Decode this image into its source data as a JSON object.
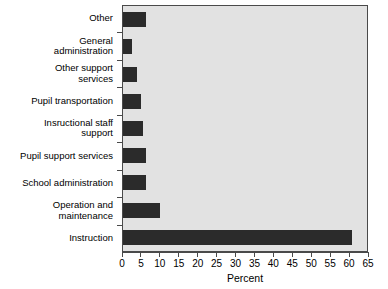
{
  "chart_data": {
    "type": "bar",
    "orientation": "horizontal",
    "title": "",
    "xlabel": "Percent",
    "ylabel": "",
    "xlim": [
      0,
      65
    ],
    "xticks": [
      0,
      5,
      10,
      15,
      20,
      25,
      30,
      35,
      40,
      45,
      50,
      55,
      60,
      65
    ],
    "xtick_labels": [
      "0",
      "5",
      "10",
      "15",
      "20",
      "25",
      "30",
      "35",
      "40",
      "45",
      "50",
      "55",
      "60",
      "65"
    ],
    "grid": false,
    "legend": null,
    "categories": [
      "Other",
      "General\nadministration",
      "Other support\nservices",
      "Pupil transportation",
      "Insructional staff\nsupport",
      "Pupil support services",
      "School administration",
      "Operation and\nmaintenance",
      "Instruction"
    ],
    "values": [
      6.0,
      2.5,
      3.6,
      4.8,
      5.2,
      6.0,
      6.0,
      9.8,
      61.0
    ],
    "bar_color": "#2b2b2b",
    "plot_background": "#e2e2e2",
    "axis_color": "#4a4a4a",
    "figure_background": "#ffffff"
  }
}
